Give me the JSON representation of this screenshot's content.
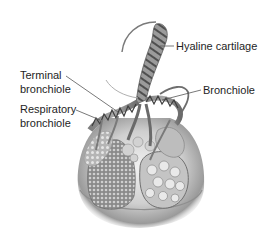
{
  "diagram": {
    "labels": {
      "hyaline_cartilage": "Hyaline cartilage",
      "bronchiole": "Bronchiole",
      "terminal_bronchiole_line1": "Terminal",
      "terminal_bronchiole_line2": "bronchiole",
      "respiratory_bronchiole_line1": "Respiratory",
      "respiratory_bronchiole_line2": "bronchiole"
    },
    "colors": {
      "text": "#1e1e1e",
      "leader_line": "#555555",
      "tissue_dark": "#5a5a5a",
      "tissue_light": "#bdbdbd",
      "background": "#ffffff"
    }
  }
}
